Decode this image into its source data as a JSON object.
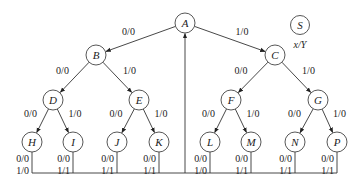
{
  "legend": {
    "node_label": "S",
    "caption": "x/Y"
  },
  "nodes": [
    {
      "id": "A",
      "x": 185,
      "y": 23
    },
    {
      "id": "B",
      "x": 96,
      "y": 55
    },
    {
      "id": "C",
      "x": 275,
      "y": 55
    },
    {
      "id": "D",
      "x": 53,
      "y": 100
    },
    {
      "id": "E",
      "x": 139,
      "y": 100
    },
    {
      "id": "F",
      "x": 231,
      "y": 100
    },
    {
      "id": "G",
      "x": 318,
      "y": 100
    },
    {
      "id": "H",
      "x": 32,
      "y": 142
    },
    {
      "id": "I",
      "x": 73,
      "y": 142
    },
    {
      "id": "J",
      "x": 117,
      "y": 142
    },
    {
      "id": "K",
      "x": 159,
      "y": 142
    },
    {
      "id": "L",
      "x": 210,
      "y": 142
    },
    {
      "id": "M",
      "x": 251,
      "y": 142
    },
    {
      "id": "N",
      "x": 295,
      "y": 142
    },
    {
      "id": "P",
      "x": 337,
      "y": 142
    }
  ],
  "edges": [
    {
      "from": "A",
      "to": "B",
      "label": "0/0"
    },
    {
      "from": "A",
      "to": "C",
      "label": "1/0"
    },
    {
      "from": "B",
      "to": "D",
      "label": "0/0"
    },
    {
      "from": "B",
      "to": "E",
      "label": "1/0"
    },
    {
      "from": "C",
      "to": "F",
      "label": "0/0"
    },
    {
      "from": "C",
      "to": "G",
      "label": "1/0"
    },
    {
      "from": "D",
      "to": "H",
      "label": "0/0"
    },
    {
      "from": "D",
      "to": "I",
      "label": "1/0"
    },
    {
      "from": "E",
      "to": "J",
      "label": "0/0"
    },
    {
      "from": "E",
      "to": "K",
      "label": "1/0"
    },
    {
      "from": "F",
      "to": "L",
      "label": "0/0"
    },
    {
      "from": "F",
      "to": "M",
      "label": "1/0"
    },
    {
      "from": "G",
      "to": "N",
      "label": "0/0"
    },
    {
      "from": "G",
      "to": "P",
      "label": "1/0"
    }
  ],
  "leaf_returns": [
    {
      "node": "H",
      "labels": [
        "0/0",
        "1/0"
      ]
    },
    {
      "node": "I",
      "labels": [
        "0/0",
        "1/1"
      ]
    },
    {
      "node": "J",
      "labels": [
        "0/0",
        "1/1"
      ]
    },
    {
      "node": "K",
      "labels": [
        "0/0",
        "1/1"
      ]
    },
    {
      "node": "L",
      "labels": [
        "0/0",
        "1/0"
      ]
    },
    {
      "node": "M",
      "labels": [
        "0/0",
        "1/1"
      ]
    },
    {
      "node": "N",
      "labels": [
        "0/0",
        "1/1"
      ]
    },
    {
      "node": "P",
      "labels": [
        "0/0",
        "1/1"
      ]
    }
  ],
  "return_target": "A"
}
